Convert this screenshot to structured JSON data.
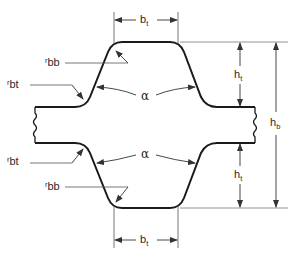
{
  "diagram": {
    "type": "cross-section dimension drawing",
    "colors": {
      "outline": "#1a1a1a",
      "dimension": "#555555",
      "background": "#ffffff"
    },
    "labels": {
      "bt_top": {
        "main": "b",
        "sub": "t"
      },
      "bt_bottom": {
        "main": "b",
        "sub": "t"
      },
      "rbb_top": {
        "main": "r",
        "sub": "bb"
      },
      "rbt_top": {
        "main": "r",
        "sub": "bt"
      },
      "rbt_bottom": {
        "main": "r",
        "sub": "bt"
      },
      "rbb_bottom": {
        "main": "r",
        "sub": "bb"
      },
      "alpha_top": "α",
      "alpha_bottom": "α",
      "ht_top": {
        "main": "h",
        "sub": "t"
      },
      "ht_bottom": {
        "main": "h",
        "sub": "t"
      },
      "hb": {
        "main": "h",
        "sub": "b"
      }
    }
  }
}
